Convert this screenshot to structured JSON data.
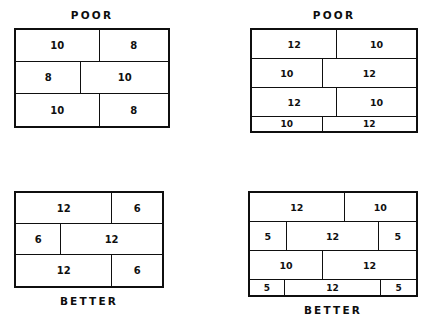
{
  "page": {
    "background_color": "#ffffff",
    "ink_color": "#0f0f0f"
  },
  "figures": [
    {
      "id": "top-left",
      "position": "top-left",
      "caption": "POOR",
      "caption_position": "top",
      "quality": "poor",
      "rows": [
        {
          "height": 32,
          "cells": [
            {
              "label": "10",
              "width_pct": 55
            },
            {
              "label": "8",
              "width_pct": 45
            }
          ]
        },
        {
          "height": 32,
          "cells": [
            {
              "label": "8",
              "width_pct": 43
            },
            {
              "label": "10",
              "width_pct": 57
            }
          ]
        },
        {
          "height": 32,
          "cells": [
            {
              "label": "10",
              "width_pct": 55
            },
            {
              "label": "8",
              "width_pct": 45
            }
          ]
        }
      ]
    },
    {
      "id": "top-right",
      "position": "top-right",
      "caption": "POOR",
      "caption_position": "top",
      "quality": "poor",
      "rows": [
        {
          "height": 29,
          "cells": [
            {
              "label": "12",
              "width_pct": 52
            },
            {
              "label": "10",
              "width_pct": 48
            }
          ]
        },
        {
          "height": 29,
          "cells": [
            {
              "label": "10",
              "width_pct": 43
            },
            {
              "label": "12",
              "width_pct": 57
            }
          ]
        },
        {
          "height": 29,
          "cells": [
            {
              "label": "12",
              "width_pct": 52
            },
            {
              "label": "10",
              "width_pct": 48
            }
          ]
        },
        {
          "height": 14,
          "cells": [
            {
              "label": "10",
              "width_pct": 43
            },
            {
              "label": "12",
              "width_pct": 57
            }
          ]
        }
      ]
    },
    {
      "id": "bottom-left",
      "position": "bottom-left",
      "caption": "BETTER",
      "caption_position": "bottom",
      "quality": "better",
      "rows": [
        {
          "height": 31,
          "cells": [
            {
              "label": "12",
              "width_pct": 66
            },
            {
              "label": "6",
              "width_pct": 34
            }
          ]
        },
        {
          "height": 31,
          "cells": [
            {
              "label": "6",
              "width_pct": 31
            },
            {
              "label": "12",
              "width_pct": 69
            }
          ]
        },
        {
          "height": 31,
          "cells": [
            {
              "label": "12",
              "width_pct": 66
            },
            {
              "label": "6",
              "width_pct": 34
            }
          ]
        }
      ]
    },
    {
      "id": "bottom-right",
      "position": "bottom-right",
      "caption": "BETTER",
      "caption_position": "bottom",
      "quality": "better",
      "rows": [
        {
          "height": 29,
          "cells": [
            {
              "label": "12",
              "width_pct": 57
            },
            {
              "label": "10",
              "width_pct": 43
            }
          ]
        },
        {
          "height": 29,
          "cells": [
            {
              "label": "5",
              "width_pct": 22
            },
            {
              "label": "12",
              "width_pct": 56
            },
            {
              "label": "5",
              "width_pct": 22
            }
          ]
        },
        {
          "height": 29,
          "cells": [
            {
              "label": "10",
              "width_pct": 44
            },
            {
              "label": "12",
              "width_pct": 56
            }
          ]
        },
        {
          "height": 15,
          "cells": [
            {
              "label": "5",
              "width_pct": 21
            },
            {
              "label": "12",
              "width_pct": 58
            },
            {
              "label": "5",
              "width_pct": 21
            }
          ]
        }
      ]
    }
  ]
}
